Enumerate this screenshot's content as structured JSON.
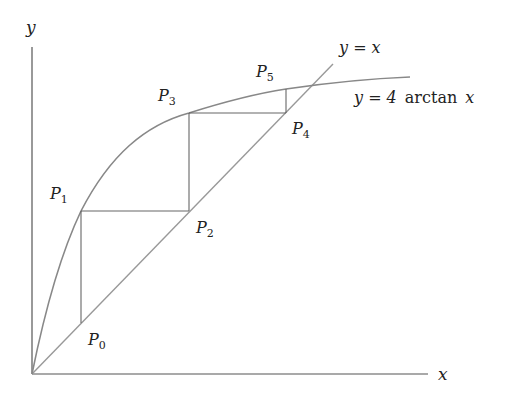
{
  "diagram": {
    "axes": {
      "x_label": "x",
      "y_label": "y"
    },
    "curves": {
      "identity_label": "y = x",
      "function_label_prefix": "y = 4",
      "function_label_fn": "arctan",
      "function_label_var": "x"
    },
    "points": [
      {
        "name": "P",
        "sub": "0"
      },
      {
        "name": "P",
        "sub": "1"
      },
      {
        "name": "P",
        "sub": "2"
      },
      {
        "name": "P",
        "sub": "3"
      },
      {
        "name": "P",
        "sub": "4"
      },
      {
        "name": "P",
        "sub": "5"
      }
    ],
    "colors": {
      "axis": "#555555",
      "curve": "#888888",
      "identity": "#999999",
      "cobweb": "#666666",
      "text": "#222222"
    }
  }
}
